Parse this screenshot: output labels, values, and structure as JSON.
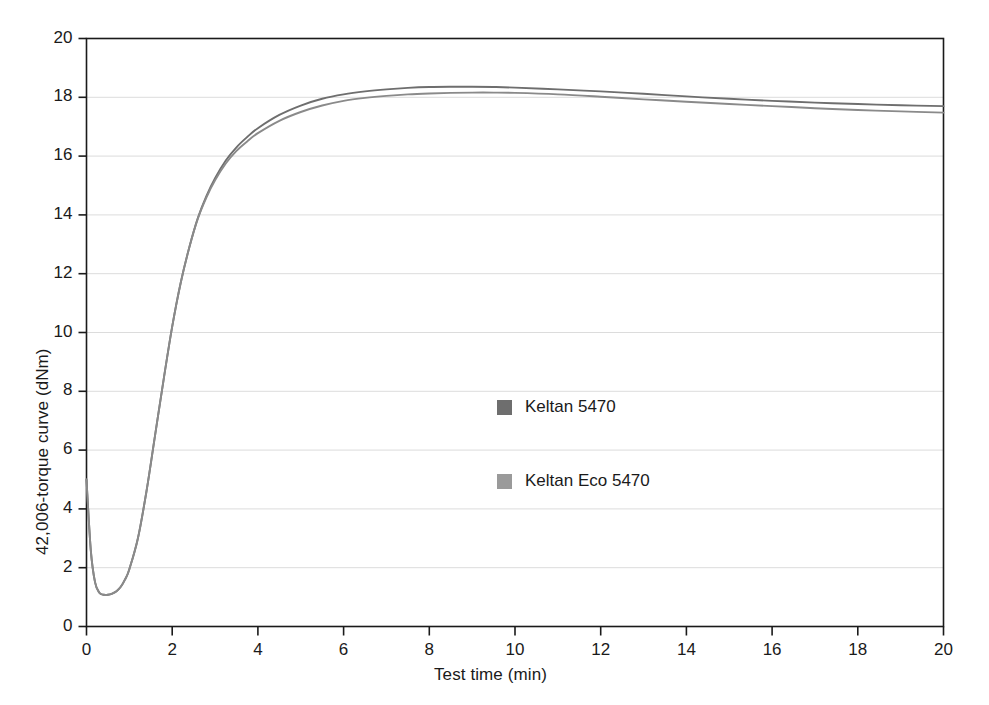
{
  "chart_data": {
    "type": "line",
    "title": "",
    "subtitle": "",
    "xlabel": "Test time (min)",
    "ylabel": "42,006-torque curve (dNm)",
    "xlim": [
      0,
      20
    ],
    "ylim": [
      0,
      20
    ],
    "xticks": [
      "0",
      "2",
      "4",
      "6",
      "8",
      "10",
      "12",
      "14",
      "16",
      "18",
      "20"
    ],
    "yticks": [
      "0",
      "2",
      "4",
      "6",
      "8",
      "10",
      "12",
      "14",
      "16",
      "18",
      "20"
    ],
    "xtick_values": [
      0,
      2,
      4,
      6,
      8,
      10,
      12,
      14,
      16,
      18,
      20
    ],
    "ytick_values": [
      0,
      2,
      4,
      6,
      8,
      10,
      12,
      14,
      16,
      18,
      20
    ],
    "grid": "horizontal",
    "legend_position": "center",
    "x": [
      0,
      0.1,
      0.2,
      0.3,
      0.4,
      0.5,
      0.6,
      0.7,
      0.8,
      0.9,
      1.0,
      1.2,
      1.4,
      1.6,
      1.8,
      2.0,
      2.2,
      2.4,
      2.6,
      2.8,
      3.0,
      3.25,
      3.5,
      3.75,
      4.0,
      4.5,
      5.0,
      5.5,
      6.0,
      6.5,
      7.0,
      7.5,
      8.0,
      8.5,
      9.0,
      9.5,
      10.0,
      11.0,
      12.0,
      13.0,
      14.0,
      15.0,
      16.0,
      17.0,
      18.0,
      19.0,
      20.0
    ],
    "series": [
      {
        "name": "Keltan 5470",
        "color": "#6e6e6e",
        "values": [
          5.0,
          2.6,
          1.5,
          1.15,
          1.08,
          1.08,
          1.12,
          1.2,
          1.35,
          1.6,
          1.95,
          3.0,
          4.6,
          6.5,
          8.4,
          10.2,
          11.7,
          12.9,
          13.9,
          14.65,
          15.25,
          15.85,
          16.3,
          16.65,
          16.95,
          17.4,
          17.72,
          17.95,
          18.1,
          18.2,
          18.27,
          18.32,
          18.35,
          18.36,
          18.36,
          18.35,
          18.33,
          18.27,
          18.2,
          18.12,
          18.03,
          17.95,
          17.88,
          17.82,
          17.77,
          17.73,
          17.7
        ]
      },
      {
        "name": "Keltan Eco 5470",
        "color": "#8a8a8a",
        "values": [
          5.0,
          2.6,
          1.5,
          1.15,
          1.08,
          1.08,
          1.12,
          1.2,
          1.35,
          1.6,
          1.95,
          3.0,
          4.6,
          6.5,
          8.4,
          10.2,
          11.7,
          12.9,
          13.88,
          14.6,
          15.18,
          15.75,
          16.18,
          16.5,
          16.78,
          17.2,
          17.5,
          17.72,
          17.88,
          17.98,
          18.05,
          18.1,
          18.13,
          18.15,
          18.16,
          18.16,
          18.15,
          18.1,
          18.02,
          17.93,
          17.85,
          17.77,
          17.7,
          17.63,
          17.57,
          17.52,
          17.48
        ]
      }
    ]
  },
  "legend": {
    "items": [
      {
        "label": "Keltan 5470",
        "color": "#6e6e6e"
      },
      {
        "label": "Keltan Eco 5470",
        "color": "#9a9a9a"
      }
    ]
  },
  "style": {
    "axis_color": "#1a1a1a",
    "grid_color": "#d8d8d8",
    "background": "#ffffff"
  }
}
